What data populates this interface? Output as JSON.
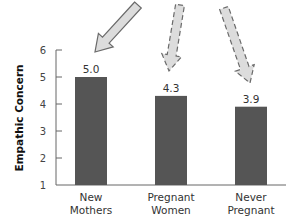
{
  "chart_data": {
    "type": "bar",
    "title": "",
    "xlabel": "",
    "ylabel": "Empathic Concern",
    "ylim": [
      1,
      6
    ],
    "yticks": [
      1,
      2,
      3,
      4,
      5,
      6
    ],
    "grid": false,
    "legend": null,
    "categories": [
      "New Mothers",
      "Pregnant Women",
      "Never Pregnant"
    ],
    "category_lines": [
      [
        "New",
        "Mothers"
      ],
      [
        "Pregnant",
        "Women"
      ],
      [
        "Never",
        "Pregnant"
      ]
    ],
    "values": [
      5.0,
      4.3,
      3.9
    ],
    "value_labels": [
      "5.0",
      "4.3",
      "3.9"
    ],
    "bar_color": "#555555",
    "annotations": [
      {
        "type": "arrow",
        "style": "solid",
        "target": "New Mothers"
      },
      {
        "type": "arrow",
        "style": "dashed",
        "target": "Pregnant Women"
      },
      {
        "type": "arrow",
        "style": "dashed",
        "target": "Never Pregnant"
      }
    ]
  },
  "colors": {
    "bar": "#555555",
    "axis": "#666666",
    "arrow_fill": "#dcdcdc",
    "arrow_stroke": "#6a6a6a"
  }
}
